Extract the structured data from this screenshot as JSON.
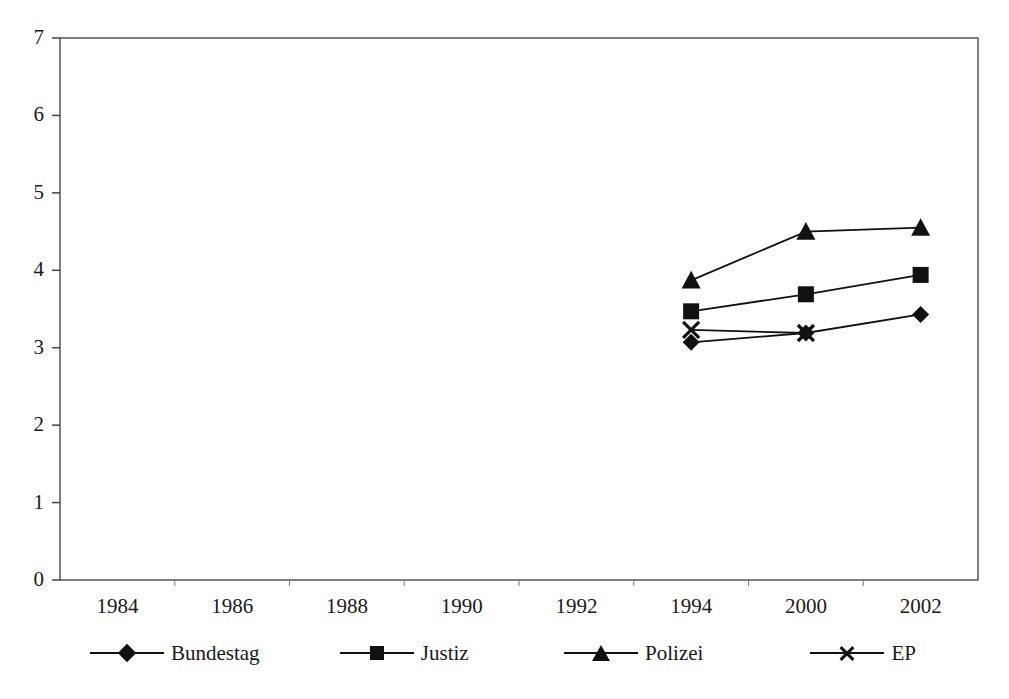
{
  "chart_data": {
    "type": "line",
    "title": "",
    "subtitle": "",
    "xlabel": "",
    "ylabel": "",
    "categories": [
      "1984",
      "1986",
      "1988",
      "1990",
      "1992",
      "1994",
      "2000",
      "2002"
    ],
    "ylim": [
      0,
      7
    ],
    "ytick_labels": [
      "7",
      "6",
      "5",
      "4",
      "3",
      "2",
      "1",
      "0"
    ],
    "ytick_values": [
      7,
      6,
      5,
      4,
      3,
      2,
      1,
      0
    ],
    "grid": false,
    "legend_position": "bottom",
    "series": [
      {
        "name": "Bundestag",
        "marker": "diamond",
        "color": "#111111",
        "x": [
          "1994",
          "2000",
          "2002"
        ],
        "values": [
          3.07,
          3.19,
          3.43
        ]
      },
      {
        "name": "Justiz",
        "marker": "square",
        "color": "#111111",
        "x": [
          "1994",
          "2000",
          "2002"
        ],
        "values": [
          3.47,
          3.69,
          3.94
        ]
      },
      {
        "name": "Polizei",
        "marker": "triangle",
        "color": "#111111",
        "x": [
          "1994",
          "2000",
          "2002"
        ],
        "values": [
          3.87,
          4.5,
          4.55
        ]
      },
      {
        "name": "EP",
        "marker": "cross",
        "color": "#111111",
        "x": [
          "1994",
          "2000"
        ],
        "values": [
          3.23,
          3.19
        ]
      }
    ]
  },
  "legend": {
    "entries": [
      {
        "label": "Bundestag",
        "marker": "diamond"
      },
      {
        "label": "Justiz",
        "marker": "square"
      },
      {
        "label": "Polizei",
        "marker": "triangle"
      },
      {
        "label": "EP",
        "marker": "cross"
      }
    ]
  },
  "colors": {
    "ink": "#111111",
    "axis": "#4a4a4a",
    "background": "#ffffff"
  }
}
